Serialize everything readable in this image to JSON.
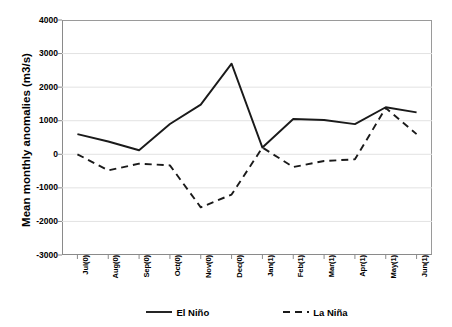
{
  "chart_data": {
    "type": "line",
    "title": "",
    "xlabel": "",
    "ylabel": "Mean monthly anomalies (m3/s)",
    "categories": [
      "Jul(0)",
      "Aug(0)",
      "Sep(0)",
      "Oct(0)",
      "Nov(0)",
      "Dec(0)",
      "Jan(1)",
      "Feb(1)",
      "Mar(1)",
      "Apr(1)",
      "May(1)",
      "Jun(1)"
    ],
    "ylim": [
      -3000,
      4000
    ],
    "yticks": [
      4000,
      3000,
      2000,
      1000,
      0,
      -1000,
      -2000,
      -3000
    ],
    "ytick_labels": [
      "4000",
      "3000",
      "2000",
      "1000",
      "0",
      "-1000",
      "-2000",
      "-3000"
    ],
    "grid": true,
    "grid_axis": "y",
    "legend_position": "bottom",
    "series": [
      {
        "name": "El Niño",
        "style": "solid",
        "color": "#1a1a1a",
        "values": [
          600,
          380,
          120,
          900,
          1480,
          2700,
          200,
          1050,
          1020,
          900,
          1400,
          1250
        ]
      },
      {
        "name": "La Niña",
        "style": "dashed",
        "color": "#1a1a1a",
        "values": [
          0,
          -480,
          -280,
          -330,
          -1580,
          -1200,
          200,
          -380,
          -200,
          -150,
          1380,
          600
        ]
      }
    ]
  }
}
